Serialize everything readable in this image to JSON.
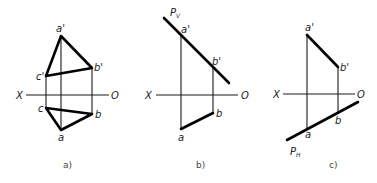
{
  "figures": [
    {
      "id": "a",
      "caption": "a)",
      "axis": {
        "left_label": "X",
        "right_label": "O"
      },
      "points": {
        "a_prime": "a'",
        "b_prime": "b'",
        "c_prime": "c'",
        "a": "a",
        "b": "b",
        "c": "c"
      }
    },
    {
      "id": "b",
      "caption": "b)",
      "axis": {
        "left_label": "X",
        "right_label": "O"
      },
      "trace_label": "P",
      "trace_sub": "V",
      "points": {
        "a_prime": "a'",
        "b_prime": "b'",
        "a": "a",
        "b": "b"
      }
    },
    {
      "id": "c",
      "caption": "c)",
      "axis": {
        "left_label": "X",
        "right_label": "O"
      },
      "trace_label": "P",
      "trace_sub": "H",
      "points": {
        "a_prime": "a'",
        "b_prime": "b'",
        "a": "a",
        "b": "b"
      }
    }
  ]
}
